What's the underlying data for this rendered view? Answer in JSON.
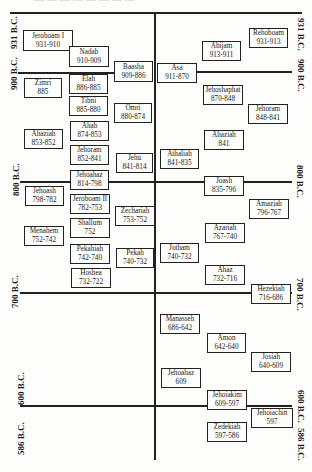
{
  "diagram": {
    "columns": {
      "left": "Israel (Northern Kingdom)",
      "right": "Judah (Southern Kingdom)"
    },
    "axis_labels": {
      "left": [
        "931 B.C.",
        "900 B.C.",
        "800 B.C.",
        "700 B.C.",
        "600 B.C.",
        "586 B.C."
      ],
      "right": [
        "931 B.C.",
        "900 B.C.",
        "800 B.C.",
        "700 B.C.",
        "600 B.C.",
        "586 B.C."
      ]
    },
    "israel_kings": [
      {
        "name": "Jeroboam I",
        "years": "931-910"
      },
      {
        "name": "Nadab",
        "years": "910-909"
      },
      {
        "name": "Baasha",
        "years": "909-886"
      },
      {
        "name": "Zimri",
        "years": "885"
      },
      {
        "name": "Elah",
        "years": "886-885"
      },
      {
        "name": "Tibni",
        "years": "885-880"
      },
      {
        "name": "Omri",
        "years": "880-874"
      },
      {
        "name": "Ahab",
        "years": "874-853"
      },
      {
        "name": "Ahaziah",
        "years": "853-852"
      },
      {
        "name": "Jehoram",
        "years": "852-841"
      },
      {
        "name": "Jehu",
        "years": "841-814"
      },
      {
        "name": "Jehoahaz",
        "years": "814-798"
      },
      {
        "name": "Jehoash",
        "years": "798-782"
      },
      {
        "name": "Jeroboam II",
        "years": "782-753"
      },
      {
        "name": "Zechariah",
        "years": "753-752"
      },
      {
        "name": "Shallum",
        "years": "752"
      },
      {
        "name": "Menahem",
        "years": "752-742"
      },
      {
        "name": "Pekahiah",
        "years": "742-740"
      },
      {
        "name": "Pekah",
        "years": "740-732"
      },
      {
        "name": "Hoshea",
        "years": "732-722"
      }
    ],
    "judah_kings": [
      {
        "name": "Rehoboam",
        "years": "931-913"
      },
      {
        "name": "Abijam",
        "years": "913-911"
      },
      {
        "name": "Asa",
        "years": "911-870"
      },
      {
        "name": "Jehoshaphat",
        "years": "870-848"
      },
      {
        "name": "Jehoram",
        "years": "848-841"
      },
      {
        "name": "Ahaziah",
        "years": "841"
      },
      {
        "name": "Athaliah",
        "years": "841-835"
      },
      {
        "name": "Joash",
        "years": "835-796"
      },
      {
        "name": "Amaziah",
        "years": "796-767"
      },
      {
        "name": "Azariah",
        "years": "767-740"
      },
      {
        "name": "Jotham",
        "years": "740-732"
      },
      {
        "name": "Ahaz",
        "years": "732-716"
      },
      {
        "name": "Hezekiah",
        "years": "716-686"
      },
      {
        "name": "Manasseh",
        "years": "686-642"
      },
      {
        "name": "Amon",
        "years": "642-640"
      },
      {
        "name": "Josiah",
        "years": "640-609"
      },
      {
        "name": "Jehoahaz",
        "years": "609"
      },
      {
        "name": "Jehoiakim",
        "years": "609-597"
      },
      {
        "name": "Jehoiachin",
        "years": "597"
      },
      {
        "name": "Zedekiah",
        "years": "597-586"
      }
    ]
  }
}
